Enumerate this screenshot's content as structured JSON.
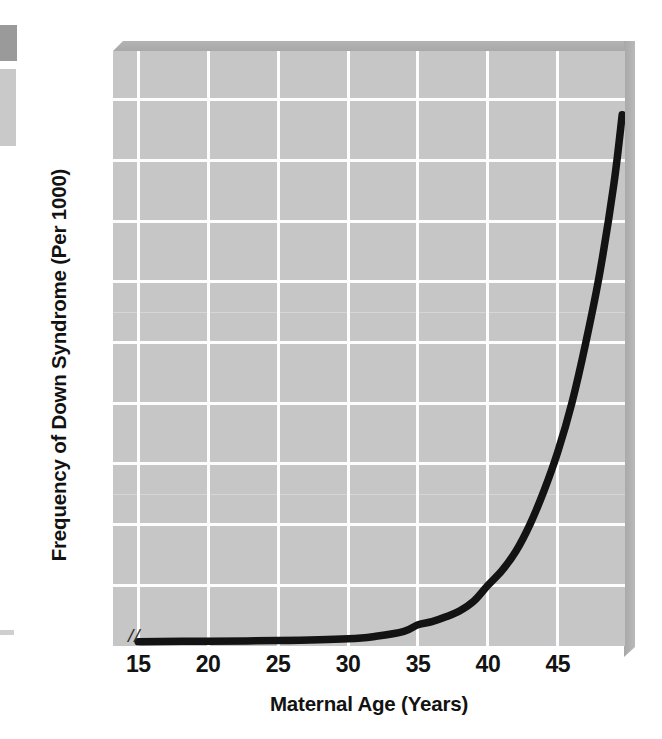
{
  "figure": {
    "y_axis_title": "Frequency of Down Syndrome (Per 1000)",
    "x_axis_title": "Maternal Age (Years)",
    "axis_break_mark": "//"
  },
  "chart_data": {
    "type": "line",
    "title": "",
    "xlabel": "Maternal Age (Years)",
    "ylabel": "Frequency of Down Syndrome (Per 1000)",
    "xlim": [
      13.2,
      49.8
    ],
    "ylim": [
      0,
      98
    ],
    "xticks": [
      15,
      20,
      25,
      30,
      35,
      40,
      45
    ],
    "yticks": [
      10,
      20,
      30,
      40,
      50,
      60,
      70,
      80,
      90
    ],
    "xtick_labels": [
      "15",
      "20",
      "25",
      "30",
      "35",
      "40",
      "45"
    ],
    "ytick_labels": [
      "10",
      "20",
      "30",
      "40",
      "50",
      "60",
      "70",
      "80",
      "90"
    ],
    "grid": true,
    "legend": "none",
    "axis_break_x": true,
    "line_color": "#131313",
    "plot_background": "#c6c6c6",
    "series": [
      {
        "name": "Down syndrome frequency",
        "x": [
          15,
          20,
          25,
          30,
          32,
          34,
          35,
          36,
          37,
          38,
          39,
          40,
          41,
          42,
          43,
          44,
          45,
          46,
          47,
          48,
          49,
          49.6
        ],
        "y": [
          0.7,
          0.8,
          0.9,
          1.2,
          1.6,
          2.4,
          3.5,
          4.0,
          4.8,
          5.8,
          7.4,
          10.0,
          12.4,
          15.6,
          20.0,
          25.5,
          32.0,
          40.0,
          50.0,
          61.5,
          76.0,
          87.5
        ]
      }
    ]
  }
}
